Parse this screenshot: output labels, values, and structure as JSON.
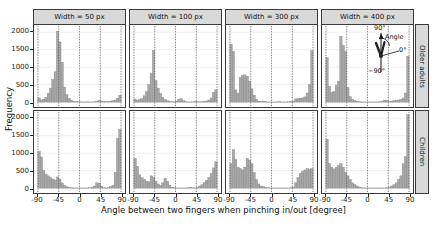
{
  "colors": {
    "strip_bg": "#d9d9d9",
    "panel_bg": "#ffffff",
    "panel_border": "#3a3a3a",
    "bar_fill": "#a7a7a7",
    "bar_stroke": "#868686",
    "grid_major": "#dcdcdc",
    "grid_minor": "#e6e6e6",
    "ref_line": "#333333",
    "text": "#111111"
  },
  "chart_data": {
    "type": "bar",
    "title": "",
    "xlabel": "Angle between two fingers when pinching in/out [degree]",
    "ylabel": "Frequency",
    "facet_cols": [
      "Width = 50 px",
      "Width = 100 px",
      "Width = 300 px",
      "Width = 400 px"
    ],
    "facet_rows": [
      "Older adults",
      "Children"
    ],
    "x_ticks": [
      -90,
      -45,
      0,
      45,
      90
    ],
    "y_ticks": [
      0,
      500,
      1000,
      1500,
      2000
    ],
    "xlim": [
      -90,
      90
    ],
    "ylim": [
      0,
      2150
    ],
    "bin_start": -90,
    "bin_width": 5,
    "grid": "dashed vertical reference lines at each x tick",
    "legend_position": "none",
    "annotation": {
      "location": "top-right facet (Older adults, Width = 400 px)",
      "label_90": "90°",
      "label_angle": "Angle",
      "label_0": "0°",
      "label_neg90": "−90°"
    },
    "series": [
      {
        "row": "Older adults",
        "col": "Width = 50 px",
        "values": [
          120,
          60,
          80,
          140,
          250,
          400,
          650,
          870,
          2030,
          1720,
          1140,
          430,
          210,
          110,
          50,
          25,
          15,
          10,
          8,
          5,
          5,
          8,
          5,
          5,
          8,
          15,
          45,
          30,
          20,
          10,
          15,
          25,
          40,
          60,
          110,
          190
        ]
      },
      {
        "row": "Older adults",
        "col": "Width = 100 px",
        "values": [
          90,
          50,
          70,
          100,
          180,
          300,
          500,
          820,
          1480,
          620,
          400,
          250,
          130,
          70,
          40,
          20,
          10,
          5,
          30,
          80,
          95,
          40,
          10,
          5,
          5,
          8,
          20,
          10,
          8,
          12,
          20,
          30,
          60,
          120,
          280,
          350
        ]
      },
      {
        "row": "Older adults",
        "col": "Width = 300 px",
        "values": [
          1650,
          1450,
          350,
          260,
          700,
          760,
          780,
          740,
          600,
          380,
          200,
          80,
          30,
          20,
          30,
          10,
          5,
          5,
          5,
          5,
          5,
          10,
          5,
          5,
          5,
          10,
          20,
          30,
          90,
          100,
          110,
          120,
          150,
          260,
          500,
          1470
        ]
      },
      {
        "row": "Older adults",
        "col": "Width = 400 px",
        "values": [
          1270,
          450,
          280,
          300,
          480,
          600,
          1880,
          1620,
          1450,
          420,
          160,
          80,
          40,
          20,
          10,
          5,
          5,
          5,
          5,
          5,
          5,
          5,
          5,
          10,
          30,
          60,
          40,
          20,
          30,
          40,
          50,
          60,
          80,
          120,
          260,
          1310
        ]
      },
      {
        "row": "Children",
        "col": "Width = 50 px",
        "values": [
          1050,
          890,
          500,
          400,
          350,
          300,
          260,
          230,
          320,
          260,
          150,
          80,
          40,
          20,
          10,
          5,
          5,
          5,
          5,
          5,
          5,
          5,
          10,
          30,
          60,
          150,
          140,
          60,
          10,
          5,
          20,
          40,
          80,
          450,
          1420,
          1680
        ]
      },
      {
        "row": "Children",
        "col": "Width = 100 px",
        "values": [
          850,
          620,
          380,
          300,
          250,
          200,
          180,
          350,
          310,
          200,
          120,
          80,
          150,
          280,
          200,
          80,
          30,
          10,
          5,
          5,
          5,
          5,
          5,
          10,
          20,
          10,
          5,
          20,
          60,
          100,
          160,
          220,
          300,
          420,
          580,
          750
        ]
      },
      {
        "row": "Children",
        "col": "Width = 300 px",
        "values": [
          700,
          1100,
          820,
          600,
          560,
          520,
          600,
          850,
          800,
          700,
          450,
          250,
          120,
          60,
          40,
          20,
          10,
          5,
          5,
          5,
          5,
          5,
          5,
          5,
          5,
          5,
          10,
          30,
          150,
          300,
          420,
          480,
          520,
          560,
          540,
          560
        ]
      },
      {
        "row": "Children",
        "col": "Width = 400 px",
        "values": [
          1400,
          700,
          600,
          550,
          600,
          650,
          700,
          600,
          450,
          350,
          250,
          150,
          100,
          60,
          30,
          10,
          5,
          5,
          5,
          5,
          5,
          5,
          5,
          5,
          5,
          5,
          10,
          30,
          60,
          100,
          150,
          250,
          350,
          700,
          900,
          2100
        ]
      }
    ]
  }
}
